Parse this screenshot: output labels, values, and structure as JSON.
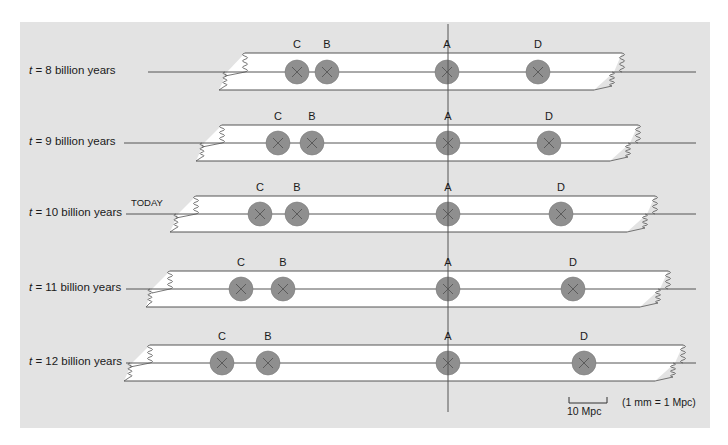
{
  "figure": {
    "background_color": "#e3e3e3",
    "strip_color": "#ffffff",
    "galaxy_color": "#8f8f8f",
    "line_color": "#555555"
  },
  "rows": [
    {
      "t_symbol": "t",
      "label": " = 8 billion years",
      "today": "",
      "strip": {
        "top": 53,
        "bottom": 90,
        "left_top": 245,
        "left_bottom": 219,
        "right_top": 622,
        "right_bottom": 594
      },
      "center_y": 72,
      "galaxies": [
        {
          "name": "C",
          "x": 297
        },
        {
          "name": "B",
          "x": 327
        },
        {
          "name": "A",
          "x": 447
        },
        {
          "name": "D",
          "x": 538
        }
      ]
    },
    {
      "t_symbol": "t",
      "label": " = 9 billion years",
      "today": "",
      "strip": {
        "top": 125,
        "bottom": 161,
        "left_top": 222,
        "left_bottom": 196,
        "right_top": 638,
        "right_bottom": 610
      },
      "center_y": 143,
      "galaxies": [
        {
          "name": "C",
          "x": 278
        },
        {
          "name": "B",
          "x": 312
        },
        {
          "name": "A",
          "x": 448
        },
        {
          "name": "D",
          "x": 549
        }
      ]
    },
    {
      "t_symbol": "t",
      "label": " = 10 billion years",
      "today": "TODAY",
      "strip": {
        "top": 196,
        "bottom": 232,
        "left_top": 196,
        "left_bottom": 170,
        "right_top": 655,
        "right_bottom": 627
      },
      "center_y": 214,
      "galaxies": [
        {
          "name": "C",
          "x": 260
        },
        {
          "name": "B",
          "x": 297
        },
        {
          "name": "A",
          "x": 448
        },
        {
          "name": "D",
          "x": 561
        }
      ]
    },
    {
      "t_symbol": "t",
      "label": " = 11 billion years",
      "today": "",
      "strip": {
        "top": 271,
        "bottom": 307,
        "left_top": 170,
        "left_bottom": 146,
        "right_top": 668,
        "right_bottom": 640
      },
      "center_y": 289,
      "galaxies": [
        {
          "name": "C",
          "x": 241
        },
        {
          "name": "B",
          "x": 283
        },
        {
          "name": "A",
          "x": 448
        },
        {
          "name": "D",
          "x": 573
        }
      ]
    },
    {
      "t_symbol": "t",
      "label": " = 12 billion years",
      "today": "",
      "strip": {
        "top": 345,
        "bottom": 381,
        "left_top": 150,
        "left_bottom": 124,
        "right_top": 683,
        "right_bottom": 655
      },
      "center_y": 363,
      "galaxies": [
        {
          "name": "C",
          "x": 222
        },
        {
          "name": "B",
          "x": 268
        },
        {
          "name": "A",
          "x": 448
        },
        {
          "name": "D",
          "x": 584
        }
      ]
    }
  ],
  "reference_axis": {
    "x": 448,
    "y_top": 24,
    "y_bottom": 412,
    "galaxy": "A"
  },
  "scale_bar": {
    "label": "10 Mpc",
    "note": "(1 mm = 1 Mpc)",
    "x1": 569,
    "x2": 607,
    "y": 403
  }
}
